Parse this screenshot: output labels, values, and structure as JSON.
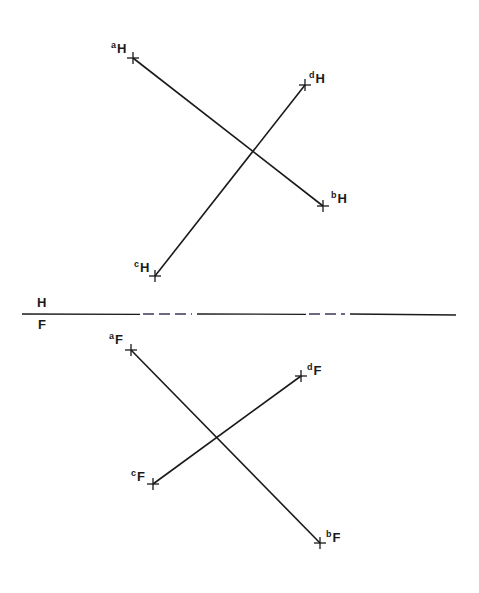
{
  "diagram": {
    "type": "orthographic-projection",
    "fold_line": {
      "label_top": "H",
      "label_bottom": "F",
      "y": 314,
      "x1": 22,
      "x2": 456,
      "dashed_segments": [
        [
          140,
          192
        ],
        [
          306,
          345
        ]
      ]
    },
    "horizontal_view": {
      "points": [
        {
          "name": "a",
          "sub": "H",
          "x": 133,
          "y": 58,
          "label_x": 111,
          "label_y": 40
        },
        {
          "name": "b",
          "sub": "H",
          "x": 323,
          "y": 206,
          "label_x": 331,
          "label_y": 190
        },
        {
          "name": "c",
          "sub": "H",
          "x": 155,
          "y": 276,
          "label_x": 134,
          "label_y": 259
        },
        {
          "name": "d",
          "sub": "H",
          "x": 305,
          "y": 85,
          "label_x": 309,
          "label_y": 70
        }
      ],
      "lines": [
        {
          "from": "a",
          "to": "b",
          "label": "ab"
        },
        {
          "from": "c",
          "to": "d",
          "label": "cd"
        }
      ]
    },
    "frontal_view": {
      "points": [
        {
          "name": "a",
          "sub": "F",
          "x": 131,
          "y": 350,
          "label_x": 109,
          "label_y": 331
        },
        {
          "name": "b",
          "sub": "F",
          "x": 320,
          "y": 543,
          "label_x": 326,
          "label_y": 529
        },
        {
          "name": "c",
          "sub": "F",
          "x": 153,
          "y": 484,
          "label_x": 131,
          "label_y": 468
        },
        {
          "name": "d",
          "sub": "F",
          "x": 301,
          "y": 376,
          "label_x": 307,
          "label_y": 362
        }
      ],
      "lines": [
        {
          "from": "a",
          "to": "b",
          "label": "ab"
        },
        {
          "from": "c",
          "to": "d",
          "label": "cd"
        }
      ]
    },
    "colors": {
      "line": "#1a1a1a",
      "background": "#ffffff",
      "dash": "#3a3a60"
    }
  }
}
